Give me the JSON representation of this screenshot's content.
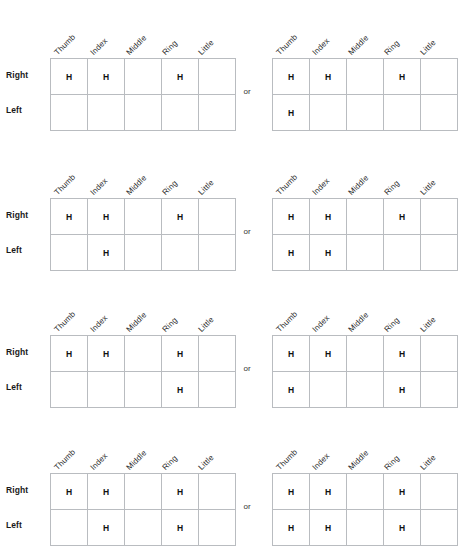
{
  "page": {
    "separator_label": "or",
    "mark": "H",
    "column_headers": [
      "Thumb",
      "Index",
      "Middle",
      "Ring",
      "Little"
    ],
    "row_headers": [
      "Right",
      "Left"
    ]
  },
  "groups": [
    {
      "id": "group-1",
      "left_table": {
        "name": "option-a",
        "rows": [
          {
            "label": "Right",
            "cells": [
              "H",
              "H",
              "",
              "H",
              ""
            ]
          },
          {
            "label": "Left",
            "cells": [
              "",
              "",
              "",
              "",
              ""
            ]
          }
        ]
      },
      "separator": "or",
      "right_table": {
        "name": "option-b",
        "rows": [
          {
            "label": "Right",
            "cells": [
              "H",
              "H",
              "",
              "H",
              ""
            ]
          },
          {
            "label": "Left",
            "cells": [
              "H",
              "",
              "",
              "",
              ""
            ]
          }
        ]
      }
    },
    {
      "id": "group-2",
      "left_table": {
        "name": "option-a",
        "rows": [
          {
            "label": "Right",
            "cells": [
              "H",
              "H",
              "",
              "H",
              ""
            ]
          },
          {
            "label": "Left",
            "cells": [
              "",
              "H",
              "",
              "",
              ""
            ]
          }
        ]
      },
      "separator": "or",
      "right_table": {
        "name": "option-b",
        "rows": [
          {
            "label": "Right",
            "cells": [
              "H",
              "H",
              "",
              "H",
              ""
            ]
          },
          {
            "label": "Left",
            "cells": [
              "H",
              "H",
              "",
              "",
              ""
            ]
          }
        ]
      }
    },
    {
      "id": "group-3",
      "left_table": {
        "name": "option-a",
        "rows": [
          {
            "label": "Right",
            "cells": [
              "H",
              "H",
              "",
              "H",
              ""
            ]
          },
          {
            "label": "Left",
            "cells": [
              "",
              "",
              "",
              "H",
              ""
            ]
          }
        ]
      },
      "separator": "or",
      "right_table": {
        "name": "option-b",
        "rows": [
          {
            "label": "Right",
            "cells": [
              "H",
              "H",
              "",
              "H",
              ""
            ]
          },
          {
            "label": "Left",
            "cells": [
              "H",
              "",
              "",
              "H",
              ""
            ]
          }
        ]
      }
    },
    {
      "id": "group-4",
      "left_table": {
        "name": "option-a",
        "rows": [
          {
            "label": "Right",
            "cells": [
              "H",
              "H",
              "",
              "H",
              ""
            ]
          },
          {
            "label": "Left",
            "cells": [
              "",
              "H",
              "",
              "H",
              ""
            ]
          }
        ]
      },
      "separator": "or",
      "right_table": {
        "name": "option-b",
        "rows": [
          {
            "label": "Right",
            "cells": [
              "H",
              "H",
              "",
              "H",
              ""
            ]
          },
          {
            "label": "Left",
            "cells": [
              "H",
              "H",
              "",
              "H",
              ""
            ]
          }
        ]
      }
    }
  ],
  "colors": {
    "grid_line": "#b9bcc0",
    "text": "#1a1a1a",
    "background": "#ffffff"
  }
}
